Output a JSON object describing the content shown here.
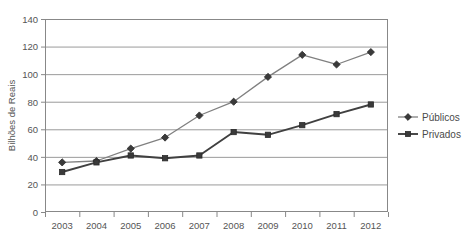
{
  "chart_data": {
    "type": "line",
    "title": "",
    "xlabel": "",
    "ylabel": "Bilhões de Reais",
    "categories": [
      "2003",
      "2004",
      "2005",
      "2006",
      "2007",
      "2008",
      "2009",
      "2010",
      "2011",
      "2012"
    ],
    "series": [
      {
        "name": "Públicos",
        "marker": "diamond",
        "color": "#808080",
        "values": [
          36,
          37,
          46,
          54,
          70,
          80,
          98,
          114,
          107,
          116
        ]
      },
      {
        "name": "Privados",
        "marker": "square",
        "color": "#404040",
        "values": [
          29,
          36,
          41,
          39,
          41,
          58,
          56,
          63,
          71,
          78
        ]
      }
    ],
    "ylim": [
      0,
      140
    ],
    "yticks": [
      "0",
      "20",
      "40",
      "60",
      "80",
      "100",
      "120",
      "140"
    ],
    "ytick_values": [
      0,
      20,
      40,
      60,
      80,
      100,
      120,
      140
    ],
    "grid": true,
    "grid_axis": "y",
    "legend_position": "right",
    "plot_border": true
  },
  "legend": {
    "items": [
      {
        "label": "Públicos",
        "marker": "diamond-marker-icon"
      },
      {
        "label": "Privados",
        "marker": "square-marker-icon"
      }
    ]
  },
  "colors": {
    "series_publicos": "#808080",
    "series_privados": "#404040",
    "gridline": "#9a9a9a",
    "axis": "#888888",
    "text": "#555555",
    "background": "#ffffff"
  }
}
